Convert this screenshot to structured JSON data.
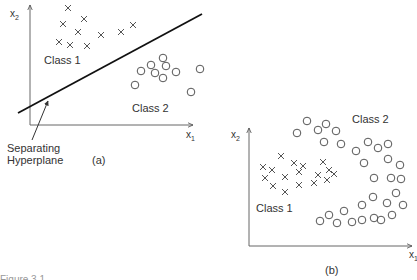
{
  "figure": {
    "caption_partial": "Figure 3.1",
    "colors": {
      "ink": "#2a2a2a",
      "axis": "#555555",
      "marker": "#555555"
    }
  },
  "panel_a": {
    "label": "(a)",
    "x_axis_label": "x",
    "x_axis_sub": "1",
    "y_axis_label": "x",
    "y_axis_sub": "2",
    "class1_label": "Class 1",
    "class2_label": "Class 2",
    "hyperplane_label_line1": "Separating",
    "hyperplane_label_line2": "Hyperplane",
    "hyperplane": {
      "x1": 18,
      "y1": 113,
      "x2": 202,
      "y2": 14
    },
    "class1_points": [
      [
        68,
        8
      ],
      [
        63,
        24
      ],
      [
        84,
        19
      ],
      [
        78,
        32
      ],
      [
        101,
        35
      ],
      [
        121,
        32
      ],
      [
        133,
        25
      ],
      [
        59,
        42
      ],
      [
        70,
        45
      ],
      [
        87,
        46
      ]
    ],
    "class2_points": [
      [
        141,
        71
      ],
      [
        151,
        65
      ],
      [
        163,
        58
      ],
      [
        155,
        73
      ],
      [
        166,
        66
      ],
      [
        176,
        72
      ],
      [
        163,
        78
      ],
      [
        135,
        85
      ],
      [
        200,
        69
      ],
      [
        191,
        92
      ]
    ]
  },
  "panel_b": {
    "label": "(b)",
    "x_axis_label": "x",
    "x_axis_sub": "1",
    "y_axis_label": "x",
    "y_axis_sub": "2",
    "class1_label": "Class 1",
    "class2_label": "Class 2",
    "class1_points": [
      [
        281,
        156
      ],
      [
        263,
        167
      ],
      [
        272,
        170
      ],
      [
        294,
        163
      ],
      [
        303,
        166
      ],
      [
        299,
        172
      ],
      [
        265,
        178
      ],
      [
        273,
        186
      ],
      [
        285,
        177
      ],
      [
        285,
        192
      ],
      [
        299,
        185
      ],
      [
        314,
        183
      ],
      [
        323,
        162
      ],
      [
        329,
        170
      ],
      [
        334,
        174
      ],
      [
        318,
        175
      ],
      [
        327,
        180
      ]
    ],
    "class2_points": [
      [
        307,
        121
      ],
      [
        326,
        124
      ],
      [
        297,
        133
      ],
      [
        318,
        130
      ],
      [
        336,
        131
      ],
      [
        324,
        142
      ],
      [
        341,
        144
      ],
      [
        356,
        151
      ],
      [
        368,
        142
      ],
      [
        378,
        148
      ],
      [
        388,
        144
      ],
      [
        364,
        163
      ],
      [
        388,
        159
      ],
      [
        400,
        165
      ],
      [
        374,
        178
      ],
      [
        391,
        178
      ],
      [
        401,
        179
      ],
      [
        362,
        205
      ],
      [
        373,
        197
      ],
      [
        387,
        203
      ],
      [
        396,
        193
      ],
      [
        403,
        205
      ],
      [
        320,
        221
      ],
      [
        329,
        215
      ],
      [
        337,
        223
      ],
      [
        344,
        211
      ],
      [
        352,
        222
      ],
      [
        362,
        220
      ],
      [
        374,
        218
      ],
      [
        381,
        220
      ],
      [
        392,
        215
      ]
    ]
  }
}
